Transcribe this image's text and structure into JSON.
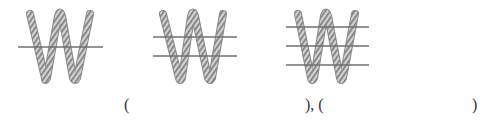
{
  "figures": [
    {
      "id": "figure-1",
      "shape": "W-rope",
      "cut_lines": 1,
      "line_ys": [
        47
      ],
      "line_x": [
        18,
        103
      ],
      "peaks_x": [
        30,
        60,
        90
      ],
      "valleys_x": [
        45,
        75
      ]
    },
    {
      "id": "figure-2",
      "shape": "W-rope",
      "cut_lines": 2,
      "line_ys": [
        37,
        56
      ],
      "line_x": [
        153,
        237
      ],
      "peaks_x": [
        163,
        193,
        223
      ],
      "valleys_x": [
        180,
        210
      ]
    },
    {
      "id": "figure-3",
      "shape": "W-rope",
      "cut_lines": 3,
      "line_ys": [
        27,
        46,
        65
      ],
      "line_x": [
        286,
        369
      ],
      "peaks_x": [
        298,
        326,
        355
      ],
      "valleys_x": [
        312,
        341
      ]
    }
  ],
  "colors": {
    "rope_fill": "#c8c8c8",
    "rope_stripe": "#7a7a7a",
    "rope_edge": "#8c8c8c",
    "cut_line": "#707070",
    "text": "#333333"
  },
  "answer_row": {
    "open_1": "(",
    "close_open": "), (",
    "close_2": ")"
  }
}
